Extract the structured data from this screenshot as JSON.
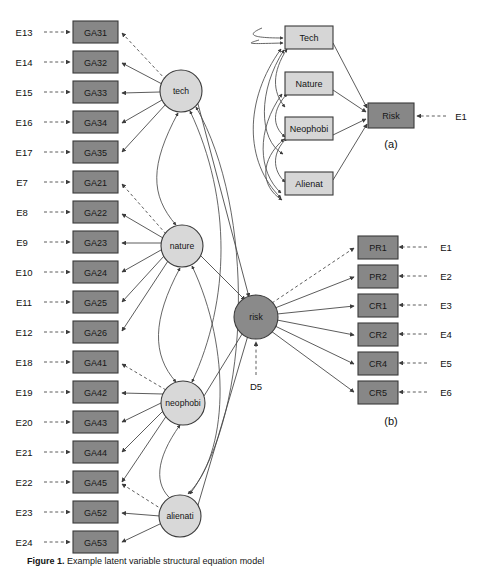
{
  "figure": {
    "caption_prefix": "Figure 1.",
    "caption_text": "Example latent variable structural equation model",
    "background_color": "#ffffff"
  },
  "colors": {
    "observed_dark": "#878787",
    "observed_light": "#d6d6d6",
    "latent_light": "#d8d8d8",
    "latent_dark": "#8a8a8a",
    "stroke": "#3a3a3a",
    "edge": "#4a4a4a"
  },
  "main_model": {
    "indicator_errors": [
      "E13",
      "E14",
      "E15",
      "E16",
      "E17",
      "E7",
      "E8",
      "E9",
      "E10",
      "E11",
      "E12",
      "E18",
      "E19",
      "E20",
      "E21",
      "E22",
      "E23",
      "E24",
      "E25"
    ],
    "indicators": [
      "GA31",
      "GA32",
      "GA33",
      "GA34",
      "GA35",
      "GA21",
      "GA22",
      "GA23",
      "GA24",
      "GA25",
      "GA26",
      "GA41",
      "GA42",
      "GA43",
      "GA44",
      "GA45",
      "GA52",
      "GA53",
      "GA54"
    ],
    "latents": [
      {
        "name": "tech",
        "indicators": [
          "GA31",
          "GA32",
          "GA33",
          "GA34",
          "GA35"
        ]
      },
      {
        "name": "nature",
        "indicators": [
          "GA21",
          "GA22",
          "GA23",
          "GA24",
          "GA25",
          "GA26"
        ]
      },
      {
        "name": "neophobi",
        "indicators": [
          "GA41",
          "GA42",
          "GA43",
          "GA44",
          "GA45"
        ]
      },
      {
        "name": "alienati",
        "indicators": [
          "GA52",
          "GA53",
          "GA54"
        ]
      }
    ],
    "outcome_latent": "risk",
    "disturbance": "D5"
  },
  "panel_a": {
    "label": "(a)",
    "predictors": [
      "Tech",
      "Nature",
      "Neophobi",
      "Alienat"
    ],
    "outcome": "Risk",
    "outcome_error": "E1"
  },
  "panel_b": {
    "label": "(b)",
    "indicators": [
      "PR1",
      "PR2",
      "CR1",
      "CR2",
      "CR4",
      "CR5"
    ],
    "errors": [
      "E1",
      "E2",
      "E3",
      "E4",
      "E5",
      "E6"
    ]
  }
}
